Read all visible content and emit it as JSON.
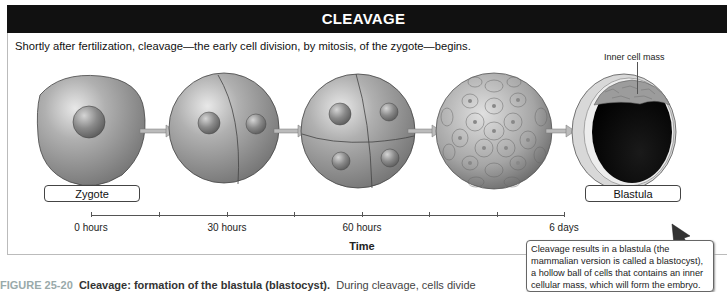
{
  "header": {
    "title": "CLEAVAGE"
  },
  "intro_text": "Shortly after fertilization, cleavage—the early cell division, by mitosis, of the zygote—begins.",
  "annotation": {
    "inner_cell_mass": "Inner cell mass"
  },
  "stages": [
    {
      "name": "zygote",
      "label": "Zygote"
    },
    {
      "name": "two-cell",
      "label": ""
    },
    {
      "name": "four-cell",
      "label": ""
    },
    {
      "name": "morula",
      "label": ""
    },
    {
      "name": "blastula",
      "label": "Blastula"
    }
  ],
  "timeline": {
    "title": "Time",
    "ticks": [
      {
        "x": 91,
        "label": "0 hours"
      },
      {
        "x": 159,
        "label": ""
      },
      {
        "x": 227,
        "label": "30 hours"
      },
      {
        "x": 294,
        "label": ""
      },
      {
        "x": 362,
        "label": "60 hours"
      },
      {
        "x": 429,
        "label": ""
      },
      {
        "x": 497,
        "label": ""
      },
      {
        "x": 564,
        "label": "6 days"
      }
    ]
  },
  "callout": {
    "text": "Cleavage results in a blastula (the mammalian version is called a blastocyst), a hollow ball of cells that contains an inner cellular mass, which will form the embryo."
  },
  "caption": {
    "figure_number": "FIGURE 25-20",
    "title": "Cleavage: formation of the blastula (blastocyst).",
    "text": "During cleavage, cells divide"
  },
  "colors": {
    "header_bg": "#111111",
    "cell_gray": "#9a9a9a",
    "dark_cavity": "#050505"
  }
}
